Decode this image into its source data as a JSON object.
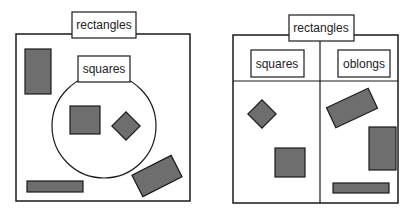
{
  "diagram": {
    "left": {
      "title": "rectangles",
      "subset_label": "squares",
      "description": "Venn-style: squares as a circular subset inside the rectangles box"
    },
    "right": {
      "title": "rectangles",
      "partitions": [
        {
          "label": "squares"
        },
        {
          "label": "oblongs"
        }
      ],
      "description": "Partition: rectangles split into squares and oblongs"
    },
    "colors": {
      "shape_fill": "#6e6e6e",
      "stroke": "#1a1a1a",
      "background": "#ffffff"
    }
  }
}
